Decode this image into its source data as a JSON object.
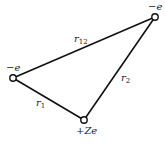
{
  "diagram": {
    "type": "three-body charge geometry",
    "colors": {
      "line": "#111111",
      "node_fill": "#ffffff",
      "text": "#222222"
    },
    "nodes": [
      {
        "id": "electron1",
        "label": "−e",
        "x": 13,
        "y": 78
      },
      {
        "id": "electron2",
        "label": "−e",
        "x": 155,
        "y": 17
      },
      {
        "id": "nucleus",
        "label": "+Ze",
        "x": 84,
        "y": 120
      }
    ],
    "edges": [
      {
        "from": "electron1",
        "to": "electron2",
        "label": "r",
        "sub": "12"
      },
      {
        "from": "electron1",
        "to": "nucleus",
        "label": "r",
        "sub": "1"
      },
      {
        "from": "electron2",
        "to": "nucleus",
        "label": "r",
        "sub": "2"
      }
    ]
  },
  "labels": {
    "electron1": "−e",
    "electron2": "−e",
    "nucleus": "+Ze",
    "r12": {
      "main": "r",
      "sub": "12"
    },
    "r1": {
      "main": "r",
      "sub": "1"
    },
    "r2": {
      "main": "r",
      "sub": "2"
    }
  }
}
